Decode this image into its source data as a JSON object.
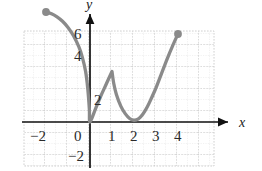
{
  "chart_data": {
    "type": "line",
    "title": "",
    "xlabel": "x",
    "ylabel": "y",
    "xlim": [
      -2.5,
      4.5
    ],
    "ylim": [
      -2.7,
      7.2
    ],
    "grid": true,
    "grid_major_step": 1,
    "grid_minor_step": 0.5,
    "legend": "none",
    "xticks": [
      -2,
      0,
      1,
      2,
      3,
      4
    ],
    "xtick_labels": [
      "−2",
      "0",
      "1",
      "2",
      "3",
      "4"
    ],
    "yticks": [
      -2,
      2,
      4,
      6
    ],
    "ytick_labels": [
      "−2",
      "2",
      "4",
      "6"
    ],
    "endpoints": [
      {
        "x": -2,
        "y": 5,
        "style": "filled-dot"
      },
      {
        "x": 4,
        "y": 4,
        "style": "filled-dot"
      }
    ],
    "curve_color": "#8a8a8a",
    "axis_color": "#111111",
    "grid_color": "#c9c9c9",
    "points": [
      {
        "x": -2.0,
        "y": 5.0
      },
      {
        "x": -1.75,
        "y": 4.92
      },
      {
        "x": -1.5,
        "y": 4.78
      },
      {
        "x": -1.25,
        "y": 4.58
      },
      {
        "x": -1.0,
        "y": 4.3
      },
      {
        "x": -0.75,
        "y": 3.92
      },
      {
        "x": -0.5,
        "y": 3.4
      },
      {
        "x": -0.35,
        "y": 2.95
      },
      {
        "x": -0.2,
        "y": 2.3
      },
      {
        "x": -0.1,
        "y": 1.5
      },
      {
        "x": -0.03,
        "y": 0.6
      },
      {
        "x": 0.0,
        "y": 0.0
      },
      {
        "x": 0.25,
        "y": 0.6
      },
      {
        "x": 0.5,
        "y": 1.2
      },
      {
        "x": 0.75,
        "y": 1.75
      },
      {
        "x": 1.0,
        "y": 2.3
      },
      {
        "x": 1.08,
        "y": 1.75
      },
      {
        "x": 1.2,
        "y": 1.25
      },
      {
        "x": 1.4,
        "y": 0.72
      },
      {
        "x": 1.6,
        "y": 0.38
      },
      {
        "x": 1.8,
        "y": 0.16
      },
      {
        "x": 2.0,
        "y": 0.08
      },
      {
        "x": 2.2,
        "y": 0.14
      },
      {
        "x": 2.4,
        "y": 0.35
      },
      {
        "x": 2.6,
        "y": 0.68
      },
      {
        "x": 2.8,
        "y": 1.1
      },
      {
        "x": 3.0,
        "y": 1.55
      },
      {
        "x": 3.25,
        "y": 2.2
      },
      {
        "x": 3.5,
        "y": 2.85
      },
      {
        "x": 3.75,
        "y": 3.45
      },
      {
        "x": 4.0,
        "y": 4.0
      }
    ]
  },
  "axis_labels": {
    "x": "x",
    "y": "y"
  },
  "tick_text": {
    "x_neg2": "−2",
    "x_0": "0",
    "x_1": "1",
    "x_2": "2",
    "x_3": "3",
    "x_4": "4",
    "y_neg2": "−2",
    "y_2": "2",
    "y_4": "4",
    "y_6": "6"
  }
}
